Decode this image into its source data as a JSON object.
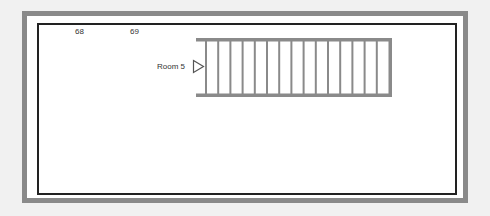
{
  "floorplan": {
    "room_numbers": [
      {
        "label": "68",
        "x": 75
      },
      {
        "label": "69",
        "x": 130
      }
    ],
    "room_label": "Room 5",
    "entry_arrow": "triangle-right",
    "stairs": {
      "treads": 15,
      "color": "#8a8a8a"
    },
    "colors": {
      "outer_wall": "#8a8a8a",
      "inner_wall": "#222222",
      "background": "#ffffff"
    }
  }
}
